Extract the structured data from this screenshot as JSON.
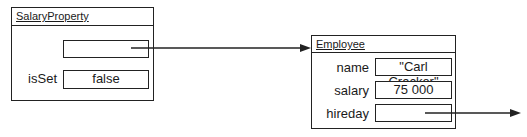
{
  "salary_property": {
    "title": "SalaryProperty",
    "fields": [
      {
        "label": "",
        "value": "",
        "type": "reference"
      },
      {
        "label": "isSet",
        "value": "false"
      }
    ]
  },
  "employee": {
    "title": "Employee",
    "fields": [
      {
        "label": "name",
        "value": "\"Carl Cracker\""
      },
      {
        "label": "salary",
        "value": "75 000"
      },
      {
        "label": "hireday",
        "value": "",
        "type": "reference"
      }
    ]
  },
  "arrows": [
    {
      "from": "salary_property.fields.0",
      "to": "employee"
    },
    {
      "from": "employee.fields.2",
      "to": "offscreen-right"
    }
  ],
  "colors": {
    "stroke": "#222222",
    "background": "#ffffff"
  }
}
